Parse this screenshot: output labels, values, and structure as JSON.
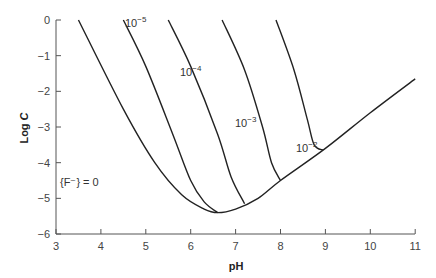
{
  "chart_data": {
    "type": "line",
    "title": "",
    "xlabel": "pH",
    "ylabel": "Log C",
    "xlim": [
      3,
      11
    ],
    "ylim": [
      -6,
      0
    ],
    "xticks": [
      "3",
      "4",
      "5",
      "6",
      "7",
      "8",
      "9",
      "10",
      "11"
    ],
    "yticks": [
      "0",
      "−1",
      "−2",
      "−3",
      "−4",
      "−5",
      "−6"
    ],
    "grid": false,
    "series": [
      {
        "name": "{F⁻} = 0",
        "label": "{F⁻} = 0",
        "points": [
          [
            3.5,
            0
          ],
          [
            4.5,
            -2.5
          ],
          [
            5.2,
            -4.0
          ],
          [
            5.8,
            -4.9
          ],
          [
            6.3,
            -5.3
          ],
          [
            6.6,
            -5.4
          ],
          [
            7.0,
            -5.3
          ],
          [
            7.5,
            -5.0
          ],
          [
            8.0,
            -4.5
          ],
          [
            9.0,
            -3.6
          ],
          [
            10.0,
            -2.6
          ],
          [
            11.0,
            -1.65
          ]
        ]
      },
      {
        "name": "10⁻⁵",
        "label": "10",
        "exp": "−5",
        "points": [
          [
            4.5,
            0
          ],
          [
            5.0,
            -1.3
          ],
          [
            5.6,
            -3.2
          ],
          [
            6.0,
            -4.5
          ],
          [
            6.3,
            -5.1
          ],
          [
            6.6,
            -5.4
          ]
        ]
      },
      {
        "name": "10⁻⁴",
        "label": "10",
        "exp": "−4",
        "points": [
          [
            5.5,
            0
          ],
          [
            6.0,
            -1.3
          ],
          [
            6.6,
            -3.2
          ],
          [
            6.9,
            -4.4
          ],
          [
            7.2,
            -5.15
          ]
        ]
      },
      {
        "name": "10⁻³",
        "label": "10",
        "exp": "−3",
        "points": [
          [
            6.7,
            0
          ],
          [
            7.2,
            -1.4
          ],
          [
            7.6,
            -3.0
          ],
          [
            7.8,
            -4.0
          ],
          [
            8.0,
            -4.5
          ]
        ]
      },
      {
        "name": "10⁻²",
        "label": "10",
        "exp": "−2",
        "points": [
          [
            7.9,
            0
          ],
          [
            8.3,
            -1.4
          ],
          [
            8.6,
            -2.8
          ],
          [
            8.75,
            -3.5
          ],
          [
            8.95,
            -3.65
          ]
        ]
      }
    ]
  }
}
